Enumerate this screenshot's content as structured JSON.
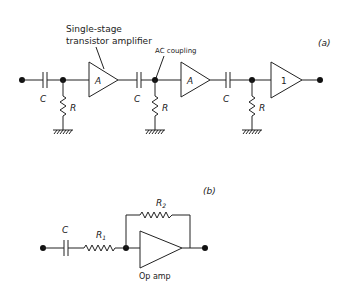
{
  "diagram_a": {
    "panel_label": "(a)",
    "annotation_amp_line1": "Single-stage",
    "annotation_amp_line2": "transistor amplifier",
    "annotation_coupling": "AC coupling",
    "stage1": {
      "cap_label": "C",
      "res_label": "R",
      "amp_label": "A"
    },
    "stage2": {
      "cap_label": "C",
      "res_label": "R",
      "amp_label": "A"
    },
    "stage3": {
      "cap_label": "C",
      "res_label": "R",
      "amp_label": "1"
    }
  },
  "diagram_b": {
    "panel_label": "(b)",
    "cap_label": "C",
    "r1_label": "R",
    "r1_sub": "1",
    "r2_label": "R",
    "r2_sub": "2",
    "opamp_label": "Op amp"
  }
}
